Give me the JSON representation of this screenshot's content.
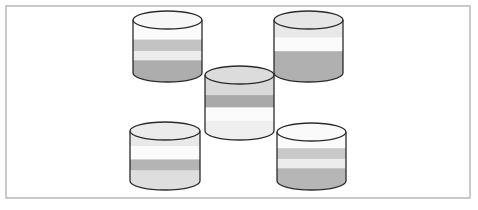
{
  "figure": {
    "title": "Five banded cylinders arranged in a quincunx pattern",
    "kind": "diagram",
    "background_color": "#ffffff",
    "width": 478,
    "height": 210
  },
  "frame": {
    "name": "outer-border-rectangle",
    "x": 6,
    "y": 6,
    "width": 464,
    "height": 192,
    "stroke_color": "#b4b4b4",
    "stroke_width": 1.4,
    "fill_color": "#ffffff"
  },
  "palette": {
    "outline": "#2b2b2b",
    "white": "#fdfdfd",
    "near_white": "#f7f7f7",
    "light_gray": "#e4e4e4",
    "pale_gray": "#efefef",
    "mid_gray": "#c6c6c6",
    "dark_gray": "#a8a8a8",
    "top_cap_light": "#ebebeb",
    "top_cap_white": "#fafafa"
  },
  "cylinders": [
    {
      "id": "cylinder-top-left",
      "label": "Top left cylinder",
      "position": "top-left",
      "x": 133,
      "y": 11,
      "width": 69,
      "height": 71,
      "cap_ry": 9,
      "top_cap_color": "#f7f7f7",
      "bands": [
        {
          "name": "band-1",
          "color": "#fbfbfb",
          "from": 0.0,
          "to": 0.37
        },
        {
          "name": "band-2",
          "color": "#c3c3c3",
          "from": 0.37,
          "to": 0.59
        },
        {
          "name": "band-3",
          "color": "#ececec",
          "from": 0.59,
          "to": 0.76
        },
        {
          "name": "band-4",
          "color": "#adadad",
          "from": 0.76,
          "to": 1.0
        }
      ]
    },
    {
      "id": "cylinder-top-right",
      "label": "Top right cylinder",
      "position": "top-right",
      "x": 274,
      "y": 11,
      "width": 69,
      "height": 71,
      "cap_ry": 9,
      "top_cap_color": "#e6e6e6",
      "bands": [
        {
          "name": "band-1",
          "color": "#e8e8e8",
          "from": 0.0,
          "to": 0.33
        },
        {
          "name": "band-2",
          "color": "#fbfbfb",
          "from": 0.33,
          "to": 0.59
        },
        {
          "name": "band-3",
          "color": "#b0b0b0",
          "from": 0.59,
          "to": 1.0
        }
      ]
    },
    {
      "id": "cylinder-center",
      "label": "Center cylinder",
      "position": "center",
      "x": 205,
      "y": 66,
      "width": 69,
      "height": 74,
      "cap_ry": 9,
      "top_cap_color": "#dcdcdc",
      "bands": [
        {
          "name": "band-1",
          "color": "#d9d9d9",
          "from": 0.0,
          "to": 0.36
        },
        {
          "name": "band-2",
          "color": "#a9a9a9",
          "from": 0.36,
          "to": 0.58
        },
        {
          "name": "band-3",
          "color": "#fbfbfb",
          "from": 0.58,
          "to": 0.82
        },
        {
          "name": "band-4",
          "color": "#efefef",
          "from": 0.82,
          "to": 1.0
        }
      ]
    },
    {
      "id": "cylinder-bottom-left",
      "label": "Bottom left cylinder",
      "position": "bottom-left",
      "x": 130,
      "y": 122,
      "width": 70,
      "height": 68,
      "cap_ry": 9,
      "top_cap_color": "#ebebeb",
      "bands": [
        {
          "name": "band-1",
          "color": "#e9e9e9",
          "from": 0.0,
          "to": 0.3
        },
        {
          "name": "band-2",
          "color": "#fbfbfb",
          "from": 0.3,
          "to": 0.57
        },
        {
          "name": "band-3",
          "color": "#b4b4b4",
          "from": 0.57,
          "to": 0.79
        },
        {
          "name": "band-4",
          "color": "#dedede",
          "from": 0.79,
          "to": 1.0
        }
      ]
    },
    {
      "id": "cylinder-bottom-right",
      "label": "Bottom right cylinder",
      "position": "bottom-right",
      "x": 277,
      "y": 123,
      "width": 69,
      "height": 67,
      "cap_ry": 9,
      "top_cap_color": "#fafafa",
      "bands": [
        {
          "name": "band-1",
          "color": "#fbfbfb",
          "from": 0.0,
          "to": 0.33
        },
        {
          "name": "band-2",
          "color": "#c9c9c9",
          "from": 0.33,
          "to": 0.55
        },
        {
          "name": "band-3",
          "color": "#ededed",
          "from": 0.55,
          "to": 0.74
        },
        {
          "name": "band-4",
          "color": "#b6b6b6",
          "from": 0.74,
          "to": 1.0
        }
      ]
    }
  ]
}
